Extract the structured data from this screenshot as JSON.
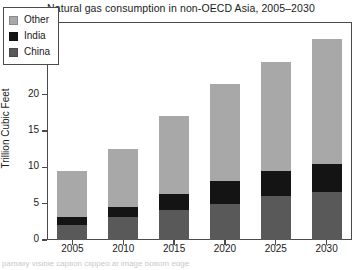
{
  "chart_data": {
    "type": "bar",
    "subtype": "stacked-bar",
    "title": "Natural gas consumption in non-OECD Asia, 2005–2030",
    "xlabel": "",
    "ylabel": "Trillion Cubic Feet",
    "categories": [
      "2005",
      "2010",
      "2015",
      "2020",
      "2025",
      "2030"
    ],
    "series": [
      {
        "name": "China",
        "color": "#595959",
        "values": [
          2.1,
          3.2,
          4.1,
          5.0,
          6.0,
          6.6
        ]
      },
      {
        "name": "India",
        "color": "#141414",
        "values": [
          1.1,
          1.4,
          2.2,
          3.1,
          3.5,
          3.9
        ]
      },
      {
        "name": "Other",
        "color": "#a8a8a8",
        "values": [
          6.3,
          7.9,
          10.7,
          13.3,
          15.0,
          17.2
        ]
      }
    ],
    "stack_order_bottom_to_top": [
      "China",
      "India",
      "Other"
    ],
    "totals": [
      9.5,
      12.5,
      17.0,
      21.4,
      24.5,
      27.7
    ],
    "ylim": [
      0,
      30
    ],
    "yticks": [
      0,
      5,
      10,
      15,
      20,
      25,
      30
    ],
    "ytick_labels": [
      "0",
      "5",
      "10",
      "15",
      "20",
      "25",
      "30"
    ],
    "grid": false,
    "legend_position": "upper-left-inside",
    "legend_entries": [
      {
        "label": "Other",
        "color": "#a8a8a8"
      },
      {
        "label": "India",
        "color": "#141414"
      },
      {
        "label": "China",
        "color": "#595959"
      }
    ],
    "frame_color": "#4a4a4a",
    "background": "#ffffff"
  },
  "caption": {
    "cutoff_text": "partially visible caption clipped at image bottom edge"
  }
}
